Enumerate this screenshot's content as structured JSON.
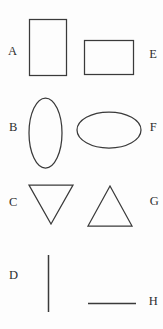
{
  "figure": {
    "width": 163,
    "height": 329,
    "background_color": "#fdfdfd",
    "stroke_color": "#3a3a3a",
    "label_color": "#2e2e2e"
  },
  "labels": {
    "a": "A",
    "b": "B",
    "c": "C",
    "d": "D",
    "e": "E",
    "f": "F",
    "g": "G",
    "h": "H"
  },
  "shapes": [
    {
      "id": "a",
      "label": "A",
      "kind": "rectangle",
      "orientation": "portrait",
      "x": 29,
      "y": 19,
      "width": 38,
      "height": 57,
      "label_side": "left"
    },
    {
      "id": "e",
      "label": "E",
      "kind": "rectangle",
      "orientation": "landscape",
      "x": 84,
      "y": 40,
      "width": 50,
      "height": 35,
      "label_side": "right"
    },
    {
      "id": "b",
      "label": "B",
      "kind": "ellipse",
      "orientation": "vertical",
      "cx": 45.5,
      "cy": 133,
      "rx": 16.5,
      "ry": 35,
      "label_side": "left"
    },
    {
      "id": "f",
      "label": "F",
      "kind": "ellipse",
      "orientation": "horizontal",
      "cx": 109,
      "cy": 130,
      "rx": 32,
      "ry": 18,
      "label_side": "right"
    },
    {
      "id": "c",
      "label": "C",
      "kind": "triangle",
      "orientation": "pointing-down",
      "points": "29,185 73,185 51,224",
      "label_side": "left"
    },
    {
      "id": "g",
      "label": "G",
      "kind": "triangle",
      "orientation": "pointing-up",
      "points": "110,186 132,226 88,226",
      "label_side": "right"
    },
    {
      "id": "d",
      "label": "D",
      "kind": "line",
      "orientation": "vertical",
      "x1": 48.5,
      "y1": 255,
      "x2": 48.5,
      "y2": 312,
      "label_side": "left"
    },
    {
      "id": "h",
      "label": "H",
      "kind": "line",
      "orientation": "horizontal",
      "x1": 88,
      "y1": 303,
      "x2": 136,
      "y2": 303,
      "label_side": "right"
    }
  ]
}
